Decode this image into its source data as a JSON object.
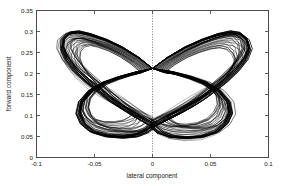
{
  "chart_data": {
    "type": "line",
    "title": "",
    "xlabel": "lateral component",
    "ylabel": "forward component",
    "xlim": [
      -0.1,
      0.1
    ],
    "ylim": [
      0.0,
      0.35
    ],
    "xticks": [
      -0.1,
      -0.05,
      0,
      0.05,
      0.1
    ],
    "xticklabels": [
      "-0.1",
      "-0.05",
      "0",
      "0.05",
      "0.1"
    ],
    "yticks": [
      0,
      0.05,
      0.1,
      0.15,
      0.2,
      0.25,
      0.3,
      0.35
    ],
    "yticklabels": [
      "0",
      "0.05",
      "0.1",
      "0.15",
      "0.2",
      "0.25",
      "0.3",
      "0.35"
    ],
    "grid": false,
    "legend": null,
    "line_color": "#000000",
    "reference_lines": [
      {
        "orientation": "vertical",
        "value": 0,
        "style": "dotted",
        "color": "#555555"
      }
    ],
    "n_cycles": 26,
    "crossing_point": [
      0.0,
      0.212
    ],
    "left_lobe": {
      "x_extent": [
        -0.078,
        -0.002
      ],
      "y_extent": [
        0.048,
        0.3
      ],
      "peak": [
        -0.03,
        0.3
      ],
      "leftmost": [
        -0.078,
        0.165
      ],
      "bottom": [
        -0.034,
        0.05
      ]
    },
    "right_lobe": {
      "x_extent": [
        0.002,
        0.084
      ],
      "y_extent": [
        0.048,
        0.3
      ],
      "peak": [
        0.032,
        0.3
      ],
      "rightmost": [
        0.084,
        0.16
      ],
      "bottom": [
        0.036,
        0.05
      ]
    },
    "series": [
      {
        "name": "cycle-trajectories",
        "note": "26 overlapping closed loops, each traversing left lobe then right lobe",
        "base_left_loop": {
          "x": [
            0.0,
            -0.012,
            -0.026,
            -0.04,
            -0.054,
            -0.064,
            -0.072,
            -0.077,
            -0.078,
            -0.074,
            -0.066,
            -0.056,
            -0.046,
            -0.038,
            -0.03,
            -0.022,
            -0.014,
            -0.006,
            0.0,
            -0.005,
            -0.014,
            -0.026,
            -0.04,
            -0.052,
            -0.06,
            -0.064,
            -0.062,
            -0.054,
            -0.042,
            -0.028,
            -0.014,
            -0.004,
            0.0
          ],
          "y": [
            0.212,
            0.238,
            0.262,
            0.28,
            0.293,
            0.299,
            0.296,
            0.283,
            0.262,
            0.236,
            0.208,
            0.182,
            0.16,
            0.142,
            0.126,
            0.112,
            0.098,
            0.086,
            0.076,
            0.062,
            0.052,
            0.049,
            0.052,
            0.062,
            0.08,
            0.104,
            0.132,
            0.158,
            0.178,
            0.192,
            0.203,
            0.209,
            0.212
          ]
        },
        "base_right_loop": {
          "x": [
            0.0,
            0.013,
            0.028,
            0.043,
            0.057,
            0.068,
            0.076,
            0.082,
            0.084,
            0.08,
            0.072,
            0.062,
            0.052,
            0.043,
            0.034,
            0.025,
            0.016,
            0.007,
            0.0,
            0.006,
            0.016,
            0.029,
            0.043,
            0.055,
            0.063,
            0.067,
            0.065,
            0.057,
            0.045,
            0.031,
            0.016,
            0.005,
            0.0
          ],
          "y": [
            0.212,
            0.238,
            0.262,
            0.28,
            0.293,
            0.299,
            0.295,
            0.281,
            0.259,
            0.233,
            0.206,
            0.18,
            0.158,
            0.14,
            0.124,
            0.11,
            0.097,
            0.085,
            0.075,
            0.061,
            0.051,
            0.048,
            0.051,
            0.062,
            0.081,
            0.105,
            0.133,
            0.159,
            0.179,
            0.193,
            0.204,
            0.209,
            0.212
          ]
        }
      }
    ]
  },
  "axes": {
    "x_axis_name": "lateral component",
    "y_axis_name": "forward component"
  }
}
